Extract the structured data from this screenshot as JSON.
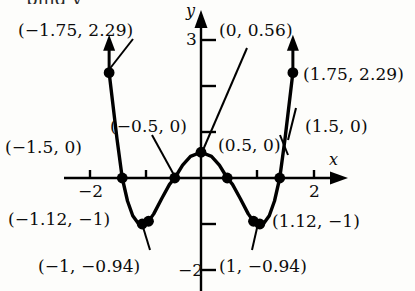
{
  "figure": {
    "kind": "cartesian-graph",
    "cutoff_text_above": "ping y",
    "axes": {
      "x_axis_label": "x",
      "y_axis_label": "y",
      "x_ticks": [
        {
          "value": -2,
          "label": "−2"
        },
        {
          "value": -1,
          "label": ""
        },
        {
          "value": 1,
          "label": ""
        },
        {
          "value": 2,
          "label": "2"
        }
      ],
      "y_ticks": [
        {
          "value": 3,
          "label": "3"
        },
        {
          "value": 2,
          "label": ""
        },
        {
          "value": 1,
          "label": ""
        },
        {
          "value": -1,
          "label": ""
        },
        {
          "value": -2,
          "label": "−2"
        }
      ],
      "xlim": [
        -2.45,
        2.45
      ],
      "ylim": [
        -2.45,
        3.45
      ],
      "grid": false
    },
    "curve_color": "#000000",
    "point_color": "#000000"
  },
  "labels": {
    "top_left": "(−1.75, 2.29)",
    "y_intercept": "(0, 0.56)",
    "top_right": "(1.75, 2.29)",
    "zero_left_outer": "(−1.5, 0)",
    "zero_left_inner": "(−0.5, 0)",
    "zero_right_inner": "(0.5, 0)",
    "zero_right_outer": "(1.5, 0)",
    "min_left": "(−1.12, −1)",
    "min_left_alt": "(−1, −0.94)",
    "min_right": "(1.12, −1)",
    "min_right_alt": "(1, −0.94)"
  },
  "chart_data": {
    "type": "line",
    "title": "",
    "xlabel": "x",
    "ylabel": "y",
    "xlim": [
      -2.45,
      2.45
    ],
    "ylim": [
      -2.45,
      3.45
    ],
    "grid": false,
    "legend": null,
    "x_tick_labels": [
      "−2",
      "2"
    ],
    "y_tick_labels": [
      "3",
      "−2"
    ],
    "series": [
      {
        "name": "polynomial curve",
        "x": [
          -1.75,
          -1.6,
          -1.5,
          -1.4,
          -1.3,
          -1.2,
          -1.12,
          -1.0,
          -0.9,
          -0.75,
          -0.6,
          -0.5,
          -0.35,
          -0.2,
          0.0,
          0.2,
          0.35,
          0.5,
          0.6,
          0.75,
          0.9,
          1.0,
          1.12,
          1.2,
          1.3,
          1.4,
          1.5,
          1.6,
          1.75
        ],
        "y": [
          2.29,
          0.85,
          0.0,
          -0.5,
          -0.82,
          -0.98,
          -1.0,
          -0.94,
          -0.78,
          -0.45,
          -0.14,
          0.0,
          0.28,
          0.47,
          0.56,
          0.47,
          0.28,
          0.0,
          -0.14,
          -0.45,
          -0.78,
          -0.94,
          -1.0,
          -0.98,
          -0.82,
          -0.5,
          0.0,
          0.85,
          2.29
        ]
      }
    ],
    "marked_points": [
      {
        "label": "(−1.75, 2.29)",
        "x": -1.75,
        "y": 2.29
      },
      {
        "label": "(−1.5, 0)",
        "x": -1.5,
        "y": 0
      },
      {
        "label": "(−1.12, −1)",
        "x": -1.12,
        "y": -1
      },
      {
        "label": "(−1, −0.94)",
        "x": -1.0,
        "y": -0.94
      },
      {
        "label": "(−0.5, 0)",
        "x": -0.5,
        "y": 0
      },
      {
        "label": "(0, 0.56)",
        "x": 0,
        "y": 0.56
      },
      {
        "label": "(0.5, 0)",
        "x": 0.5,
        "y": 0
      },
      {
        "label": "(1, −0.94)",
        "x": 1.0,
        "y": -0.94
      },
      {
        "label": "(1.12, −1)",
        "x": 1.12,
        "y": -1
      },
      {
        "label": "(1.5, 0)",
        "x": 1.5,
        "y": 0
      },
      {
        "label": "(1.75, 2.29)",
        "x": 1.75,
        "y": 2.29
      }
    ],
    "annotations": [
      {
        "text": "arrow-up-left-branch",
        "x": -1.75,
        "y": 2.29
      },
      {
        "text": "arrow-up-right-branch",
        "x": 1.75,
        "y": 2.29
      }
    ]
  }
}
